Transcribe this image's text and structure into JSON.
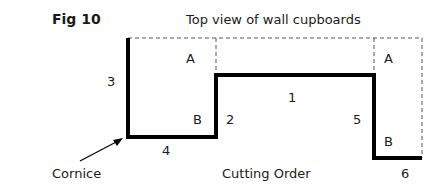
{
  "figure": {
    "number_label": "Fig 10",
    "title": "Top view of wall cupboards"
  },
  "diagram": {
    "segment_labels": [
      "1",
      "2",
      "3",
      "4",
      "5",
      "6"
    ],
    "region_labels": {
      "left_top": "A",
      "left_bottom": "B",
      "right_top": "A",
      "right_bottom": "B"
    },
    "callouts": {
      "cornice": "Cornice",
      "cutting_order": "Cutting Order"
    },
    "colors": {
      "line": "#000000",
      "dashed": "#555555",
      "text": "#1a1a1a"
    }
  }
}
